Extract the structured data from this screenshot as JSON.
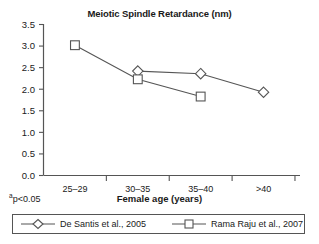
{
  "chart_data": {
    "type": "line",
    "title": "Meiotic Spindle Retardance (nm)",
    "xlabel": "Female age (years)",
    "ylabel": "",
    "categories": [
      "25–29",
      "30–35",
      "35–40",
      ">40"
    ],
    "ylim": [
      0.0,
      3.5
    ],
    "ytick_labels": [
      "0.0",
      "0.5",
      "1.0",
      "1.5",
      "2.0",
      "2.5",
      "3.0",
      "3.5"
    ],
    "ytick_values": [
      0.0,
      0.5,
      1.0,
      1.5,
      2.0,
      2.5,
      3.0,
      3.5
    ],
    "grid": false,
    "legend_position": "bottom",
    "series": [
      {
        "name": "De Santis et al., 2005",
        "marker": "diamond",
        "x": [
          "30–35",
          "35–40",
          ">40"
        ],
        "values": [
          2.42,
          2.36,
          1.93
        ]
      },
      {
        "name": "Rama Raju et al., 2007",
        "marker": "square",
        "x": [
          "25–29",
          "30–35",
          "35–40"
        ],
        "values": [
          3.02,
          2.23,
          1.83
        ]
      }
    ],
    "annotations": [
      "ap<0.05"
    ],
    "line_color": "#555555",
    "marker_fill": "#ffffff"
  },
  "footnote": {
    "superscript": "a",
    "text": "p<0.05"
  },
  "legend": {
    "items": [
      {
        "label": "De Santis et al., 2005",
        "marker": "diamond"
      },
      {
        "label": "Rama Raju et al., 2007",
        "marker": "square"
      }
    ]
  }
}
